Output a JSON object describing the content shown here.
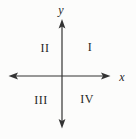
{
  "diagram": {
    "axis_labels": {
      "x": "x",
      "y": "y"
    },
    "quadrants": [
      {
        "label": "I"
      },
      {
        "label": "II"
      },
      {
        "label": "III"
      },
      {
        "label": "IV"
      }
    ],
    "colors": {
      "axis": "#333333",
      "text": "#262626",
      "background": "#fcfcfb"
    }
  }
}
